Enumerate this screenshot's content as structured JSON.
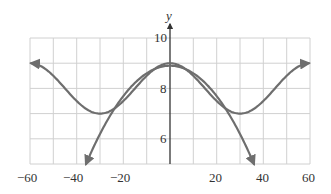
{
  "chart_data": {
    "type": "line",
    "title": "",
    "xlabel": "",
    "ylabel": "y",
    "xlim": [
      -60,
      60
    ],
    "ylim": [
      5,
      10
    ],
    "grid": true,
    "x_ticks": [
      -60,
      -40,
      -20,
      20,
      40,
      60
    ],
    "x_tick_labels": [
      "−60",
      "−40",
      "−20",
      "20",
      "40",
      "60"
    ],
    "y_ticks": [
      6,
      8,
      10
    ],
    "y_tick_labels": [
      "6",
      "8",
      "10"
    ],
    "series": [
      {
        "name": "periodic curve",
        "x": [
          -60,
          -50,
          -40,
          -30,
          -20,
          -10,
          0,
          10,
          20,
          30,
          40,
          50,
          60
        ],
        "values": [
          9.0,
          8.5,
          7.5,
          7.0,
          7.5,
          8.5,
          9.0,
          8.5,
          7.5,
          7.0,
          7.5,
          8.5,
          9.0
        ],
        "arrows": "both ends"
      },
      {
        "name": "parabolic approximation",
        "x": [
          -36,
          -30,
          -20,
          -10,
          0,
          10,
          20,
          30,
          36
        ],
        "values": [
          5.0,
          6.2,
          7.7,
          8.6,
          8.9,
          8.6,
          7.7,
          6.2,
          5.0
        ],
        "arrows": "both ends"
      }
    ],
    "legend": null
  },
  "labels": {
    "y_axis": "y",
    "x_ticks": [
      "−60",
      "−40",
      "−20",
      "20",
      "40",
      "60"
    ],
    "y_ticks": [
      "10",
      "8",
      "6"
    ]
  }
}
